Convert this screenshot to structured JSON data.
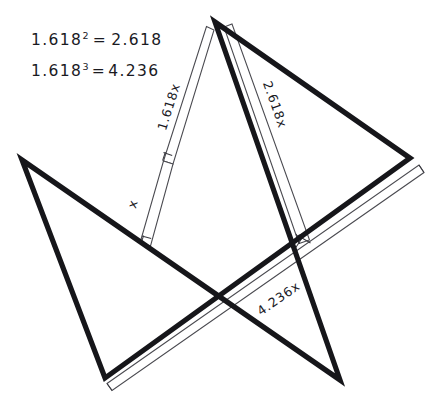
{
  "figure": {
    "background_color": "#ffffff",
    "ink_color": "#16161a",
    "thin_line_color": "#4a4a50",
    "width": 430,
    "height": 411
  },
  "equations": [
    {
      "id": "eq-square",
      "base": "1.618",
      "exponent": "2",
      "relation": "=",
      "result": "2.618",
      "full_text": "1.618² = 2.618"
    },
    {
      "id": "eq-cube",
      "base": "1.618",
      "exponent": "3",
      "relation": "=",
      "result": "4.236",
      "full_text": "1.618³ = 4.236"
    }
  ],
  "segment_labels": [
    {
      "id": "label-x",
      "text": "x",
      "edge": "left-upper-arm-inner-segment"
    },
    {
      "id": "label-1618x",
      "text": "1.618x",
      "edge": "left-upper-arm"
    },
    {
      "id": "label-2618x",
      "text": "2.618x",
      "edge": "right-upper-arm"
    },
    {
      "id": "label-4236x",
      "text": "4.236x",
      "edge": "lower-right-diagonal"
    }
  ],
  "star": {
    "type": "pentagram",
    "vertices": [
      {
        "name": "apex",
        "x": 215,
        "y": 22
      },
      {
        "name": "right-point",
        "x": 410,
        "y": 158
      },
      {
        "name": "bottom-left",
        "x": 105,
        "y": 378
      },
      {
        "name": "top-left",
        "x": 22,
        "y": 160
      },
      {
        "name": "bottom-right",
        "x": 340,
        "y": 380
      }
    ]
  }
}
